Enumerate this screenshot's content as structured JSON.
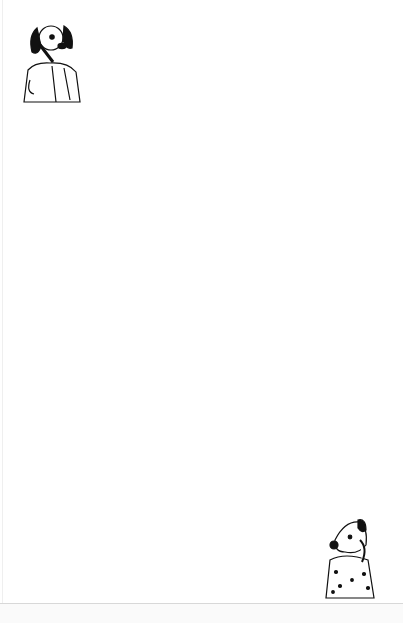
{
  "worksheet": {
    "type": "maze",
    "shape": "egg",
    "title": "",
    "wall_color": "#111111",
    "paper_color": "#ffffff"
  },
  "characters": [
    {
      "name": "dog-on-phone",
      "position": "top-left",
      "description": "Cartoon dog with floppy black ears talking on a phone"
    },
    {
      "name": "spotted-dog-on-phone",
      "position": "bottom-right",
      "description": "Spotted cartoon dog holding a phone to its ear"
    }
  ],
  "maze": {
    "entry": "top",
    "exit": "bottom",
    "outline_rows": [
      [
        32,
        175,
        247
      ],
      [
        43,
        155,
        268
      ],
      [
        54,
        143,
        278
      ],
      [
        64,
        123,
        298
      ],
      [
        75,
        123,
        300
      ],
      [
        86,
        112,
        300
      ],
      [
        97,
        103,
        310
      ],
      [
        108,
        102,
        320
      ],
      [
        119,
        92,
        330
      ],
      [
        130,
        92,
        330
      ],
      [
        140,
        82,
        340
      ],
      [
        151,
        82,
        340
      ],
      [
        162,
        72,
        350
      ],
      [
        173,
        72,
        350
      ],
      [
        184,
        72,
        350
      ],
      [
        194,
        62,
        360
      ],
      [
        205,
        62,
        365
      ],
      [
        216,
        62,
        370
      ],
      [
        227,
        62,
        370
      ],
      [
        237,
        50,
        370
      ],
      [
        248,
        50,
        370
      ],
      [
        259,
        50,
        370
      ],
      [
        270,
        50,
        370
      ],
      [
        281,
        50,
        370
      ],
      [
        291,
        50,
        370
      ],
      [
        302,
        50,
        370
      ],
      [
        313,
        50,
        370
      ],
      [
        324,
        50,
        370
      ],
      [
        335,
        50,
        370
      ],
      [
        345,
        50,
        370
      ],
      [
        356,
        50,
        370
      ],
      [
        367,
        62,
        360
      ],
      [
        378,
        62,
        360
      ],
      [
        388,
        62,
        360
      ],
      [
        399,
        62,
        360
      ],
      [
        410,
        62,
        360
      ],
      [
        420,
        72,
        350
      ],
      [
        431,
        72,
        350
      ],
      [
        442,
        82,
        345
      ],
      [
        453,
        82,
        345
      ],
      [
        464,
        92,
        330
      ],
      [
        474,
        92,
        330
      ],
      [
        485,
        92,
        330
      ],
      [
        496,
        92,
        330
      ],
      [
        507,
        102,
        310
      ],
      [
        517,
        102,
        310
      ],
      [
        528,
        122,
        285
      ],
      [
        539,
        122,
        285
      ],
      [
        550,
        175,
        250
      ],
      [
        561,
        175,
        250
      ],
      [
        572,
        175,
        250
      ],
      [
        580,
        175,
        250
      ]
    ],
    "internal_walls_h": [
      [
        140,
        230,
        43
      ],
      [
        150,
        270,
        54
      ],
      [
        170,
        210,
        64
      ],
      [
        200,
        240,
        64
      ],
      [
        130,
        260,
        75
      ],
      [
        160,
        290,
        86
      ],
      [
        115,
        180,
        97
      ],
      [
        200,
        300,
        97
      ],
      [
        110,
        220,
        108
      ],
      [
        240,
        310,
        108
      ],
      [
        100,
        160,
        119
      ],
      [
        180,
        320,
        119
      ],
      [
        95,
        240,
        130
      ],
      [
        260,
        320,
        130
      ],
      [
        90,
        180,
        140
      ],
      [
        200,
        330,
        140
      ],
      [
        85,
        150,
        151
      ],
      [
        170,
        300,
        151
      ],
      [
        80,
        260,
        162
      ],
      [
        280,
        340,
        162
      ],
      [
        75,
        170,
        173
      ],
      [
        190,
        345,
        173
      ],
      [
        90,
        330,
        184
      ],
      [
        70,
        150,
        194
      ],
      [
        180,
        300,
        194
      ],
      [
        80,
        200,
        205
      ],
      [
        230,
        350,
        205
      ],
      [
        70,
        120,
        216
      ],
      [
        140,
        290,
        216
      ],
      [
        300,
        360,
        216
      ],
      [
        65,
        250,
        227
      ],
      [
        260,
        340,
        227
      ],
      [
        60,
        130,
        237
      ],
      [
        150,
        280,
        237
      ],
      [
        300,
        365,
        237
      ],
      [
        60,
        200,
        248
      ],
      [
        210,
        360,
        248
      ],
      [
        70,
        160,
        259
      ],
      [
        180,
        290,
        259
      ],
      [
        310,
        365,
        259
      ],
      [
        60,
        100,
        270
      ],
      [
        130,
        250,
        270
      ],
      [
        270,
        360,
        270
      ],
      [
        70,
        150,
        281
      ],
      [
        165,
        300,
        281
      ],
      [
        320,
        365,
        281
      ],
      [
        60,
        180,
        291
      ],
      [
        200,
        340,
        291
      ],
      [
        70,
        160,
        302
      ],
      [
        175,
        260,
        302
      ],
      [
        280,
        365,
        302
      ],
      [
        60,
        210,
        313
      ],
      [
        230,
        330,
        313
      ],
      [
        65,
        120,
        324
      ],
      [
        140,
        300,
        324
      ],
      [
        310,
        365,
        324
      ],
      [
        60,
        250,
        335
      ],
      [
        270,
        360,
        335
      ],
      [
        70,
        170,
        345
      ],
      [
        180,
        310,
        345
      ],
      [
        60,
        140,
        356
      ],
      [
        160,
        280,
        356
      ],
      [
        300,
        365,
        356
      ],
      [
        70,
        200,
        367
      ],
      [
        220,
        350,
        367
      ],
      [
        65,
        120,
        378
      ],
      [
        140,
        310,
        378
      ],
      [
        75,
        220,
        388
      ],
      [
        240,
        355,
        388
      ],
      [
        70,
        150,
        399
      ],
      [
        165,
        290,
        399
      ],
      [
        300,
        355,
        399
      ],
      [
        80,
        200,
        410
      ],
      [
        215,
        330,
        410
      ],
      [
        75,
        140,
        420
      ],
      [
        160,
        300,
        420
      ],
      [
        310,
        345,
        420
      ],
      [
        85,
        230,
        431
      ],
      [
        250,
        345,
        431
      ],
      [
        90,
        180,
        442
      ],
      [
        200,
        320,
        442
      ],
      [
        95,
        150,
        453
      ],
      [
        170,
        290,
        453
      ],
      [
        305,
        340,
        453
      ],
      [
        100,
        250,
        464
      ],
      [
        270,
        325,
        464
      ],
      [
        110,
        200,
        474
      ],
      [
        215,
        320,
        474
      ],
      [
        105,
        160,
        485
      ],
      [
        175,
        300,
        485
      ],
      [
        110,
        230,
        496
      ],
      [
        250,
        325,
        496
      ],
      [
        115,
        190,
        507
      ],
      [
        210,
        305,
        507
      ],
      [
        120,
        240,
        517
      ],
      [
        260,
        305,
        517
      ],
      [
        130,
        210,
        528
      ],
      [
        225,
        280,
        528
      ],
      [
        140,
        260,
        539
      ],
      [
        190,
        240,
        550
      ],
      [
        180,
        215,
        561
      ],
      [
        220,
        245,
        561
      ],
      [
        185,
        230,
        572
      ]
    ],
    "internal_walls_v": [
      [
        200,
        43,
        64
      ],
      [
        225,
        54,
        75
      ],
      [
        150,
        64,
        86
      ],
      [
        260,
        75,
        97
      ],
      [
        205,
        86,
        108
      ],
      [
        175,
        97,
        119
      ],
      [
        285,
        97,
        119
      ],
      [
        135,
        108,
        130
      ],
      [
        230,
        119,
        140
      ],
      [
        160,
        130,
        151
      ],
      [
        300,
        130,
        151
      ],
      [
        110,
        140,
        162
      ],
      [
        250,
        151,
        173
      ],
      [
        185,
        162,
        184
      ],
      [
        330,
        162,
        184
      ],
      [
        95,
        173,
        194
      ],
      [
        260,
        184,
        205
      ],
      [
        345,
        194,
        216
      ],
      [
        320,
        205,
        227
      ],
      [
        85,
        216,
        237
      ],
      [
        175,
        216,
        248
      ],
      [
        250,
        227,
        248
      ],
      [
        110,
        248,
        270
      ],
      [
        215,
        248,
        270
      ],
      [
        300,
        259,
        281
      ],
      [
        90,
        270,
        291
      ],
      [
        150,
        281,
        302
      ],
      [
        330,
        291,
        313
      ],
      [
        200,
        302,
        324
      ],
      [
        120,
        313,
        335
      ],
      [
        270,
        324,
        345
      ],
      [
        100,
        335,
        356
      ],
      [
        180,
        345,
        367
      ],
      [
        315,
        356,
        378
      ],
      [
        140,
        367,
        388
      ],
      [
        230,
        378,
        399
      ],
      [
        110,
        388,
        410
      ],
      [
        290,
        399,
        420
      ],
      [
        160,
        410,
        431
      ],
      [
        255,
        420,
        442
      ],
      [
        125,
        431,
        453
      ],
      [
        205,
        442,
        464
      ],
      [
        310,
        453,
        474
      ],
      [
        140,
        464,
        485
      ],
      [
        235,
        474,
        496
      ],
      [
        170,
        485,
        507
      ],
      [
        275,
        496,
        517
      ],
      [
        195,
        507,
        528
      ],
      [
        255,
        528,
        550
      ],
      [
        208,
        550,
        572
      ]
    ]
  },
  "footer": {
    "creases_x": [
      12,
      113,
      218,
      325
    ]
  }
}
